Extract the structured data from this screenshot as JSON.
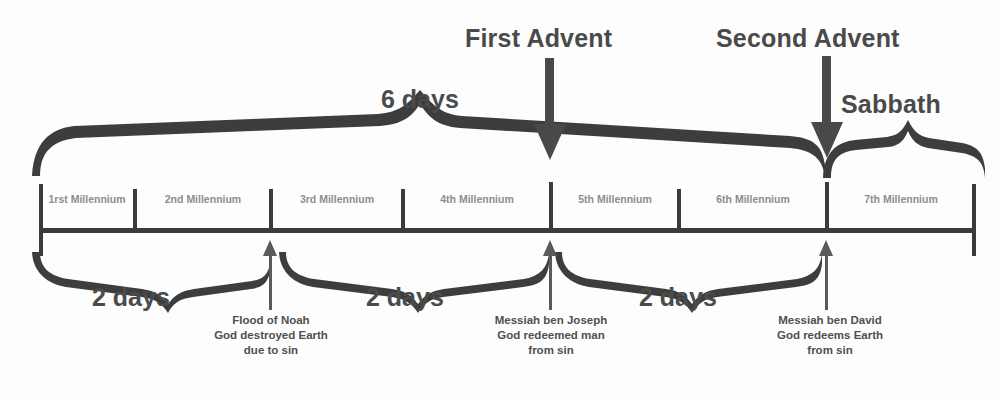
{
  "diagram": {
    "title_labels": [
      {
        "name": "first-advent",
        "text": "First Advent",
        "x": 465,
        "y": 24
      },
      {
        "name": "second-advent",
        "text": "Second Advent",
        "x": 718,
        "y": 24
      },
      {
        "name": "sabbath",
        "text": "Sabbath",
        "x": 842,
        "y": 90
      }
    ],
    "brace_labels": [
      {
        "name": "six-days",
        "text": "6 days",
        "x": 382,
        "y": 86
      },
      {
        "name": "two-days-1",
        "text": "2 days",
        "x": 92,
        "y": 282
      },
      {
        "name": "two-days-2",
        "text": "2 days",
        "x": 365,
        "y": 282
      },
      {
        "name": "two-days-3",
        "text": "2 days",
        "x": 638,
        "y": 282
      }
    ],
    "axis": {
      "x_start": 40,
      "x_end": 975,
      "y": 230,
      "tick_positions": [
        40,
        135,
        271,
        403,
        551,
        679,
        827,
        975
      ],
      "tick_top": 182,
      "tick_bottom": 255
    },
    "segments": [
      {
        "name": "millennium-1",
        "ordinal": "1rst",
        "unit": "Millennium",
        "center": 87
      },
      {
        "name": "millennium-2",
        "ordinal": "2nd",
        "unit": "Millennium",
        "center": 203
      },
      {
        "name": "millennium-3",
        "ordinal": "3rd",
        "unit": "Millennium",
        "center": 337
      },
      {
        "name": "millennium-4",
        "ordinal": "4th",
        "unit": "Millennium",
        "center": 477
      },
      {
        "name": "millennium-5",
        "ordinal": "5th",
        "unit": "Millennium",
        "center": 615
      },
      {
        "name": "millennium-6",
        "ordinal": "6th",
        "unit": "Millennium",
        "center": 753
      },
      {
        "name": "millennium-7",
        "ordinal": "7th",
        "unit": "Millennium",
        "center": 901
      }
    ],
    "annotations": [
      {
        "name": "flood-of-noah",
        "x": 271,
        "y": 314,
        "lines": [
          "Flood of Noah",
          "God destroyed Earth",
          "due to sin"
        ]
      },
      {
        "name": "messiah-ben-joseph",
        "x": 551,
        "y": 314,
        "lines": [
          "Messiah ben Joseph",
          "God redeemed man",
          "from sin"
        ]
      },
      {
        "name": "messiah-ben-david",
        "x": 830,
        "y": 314,
        "lines": [
          "Messiah ben David",
          "God redeems Earth",
          "from sin"
        ]
      }
    ],
    "colors": {
      "brace": "#3e3e3e",
      "axis": "#3a3a3a",
      "heading_text": "#4a4a4a",
      "segment_text": "#8d8d8d",
      "note_text": "#4f4f4f",
      "background": "#fdfdfd"
    }
  }
}
